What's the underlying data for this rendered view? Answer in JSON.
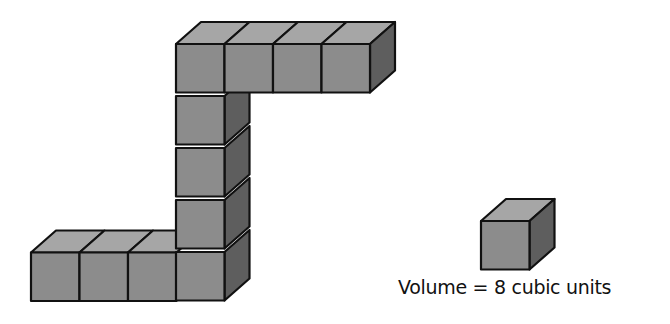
{
  "figure": {
    "cube_count_top_row": 4,
    "cube_count_column": 5,
    "cube_count_bottom_row": 4,
    "colors": {
      "front": "#8c8c8c",
      "top": "#a6a6a6",
      "side": "#5e5e5e",
      "stroke": "#111111"
    }
  },
  "reference_cube": {
    "caption": "Volume = 8 cubic units"
  }
}
